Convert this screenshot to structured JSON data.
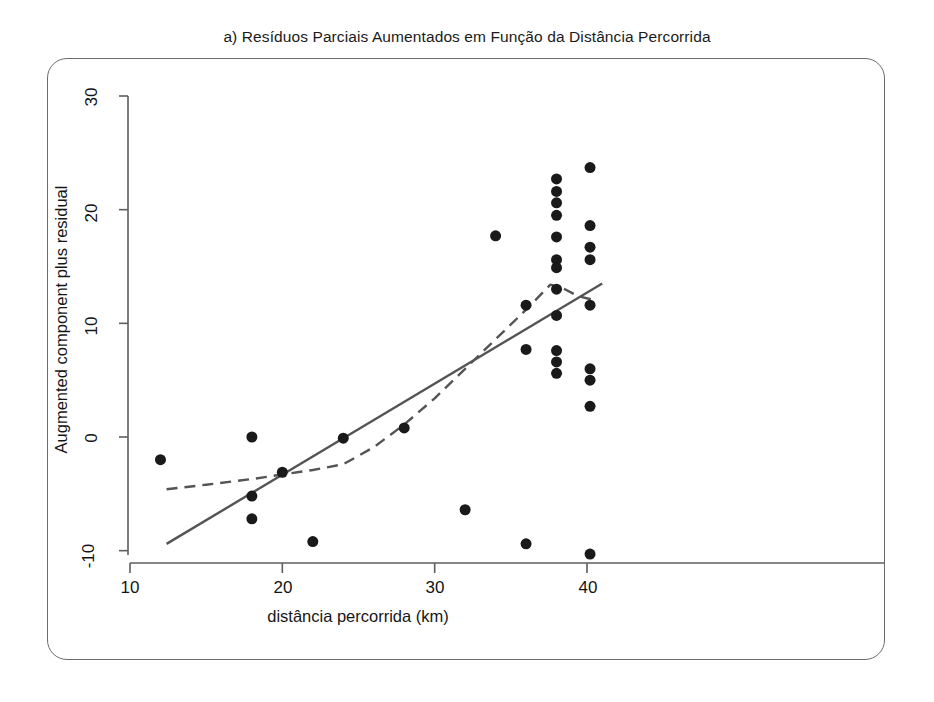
{
  "figure": {
    "title": "a) Resíduos Parciais Aumentados em Função da Distância Percorrida",
    "background_color": "#ffffff",
    "frame_color": "#6d6d6d"
  },
  "chart_data": {
    "type": "scatter",
    "title": "a) Resíduos Parciais Aumentados em Função da Distância Percorrida",
    "xlabel": "distância percorrida (km)",
    "ylabel": "Augmented component plus residual",
    "xlim": [
      9.0,
      41.5
    ],
    "ylim": [
      -11.2,
      32.5
    ],
    "xticks": [
      10,
      20,
      30,
      40
    ],
    "xtick_labels": [
      "10",
      "20",
      "30",
      "40"
    ],
    "yticks": [
      -10,
      0,
      10,
      20,
      30
    ],
    "ytick_labels": [
      "-10",
      "0",
      "10",
      "20",
      "30"
    ],
    "grid": false,
    "legend": null,
    "marker": {
      "shape": "circle",
      "color": "#1a1a1a",
      "size_px": 11
    },
    "points": [
      {
        "x": 12.0,
        "y": -2.0
      },
      {
        "x": 18.0,
        "y": 0.0
      },
      {
        "x": 18.0,
        "y": -5.2
      },
      {
        "x": 18.0,
        "y": -7.2
      },
      {
        "x": 20.0,
        "y": -3.1
      },
      {
        "x": 22.0,
        "y": -9.2
      },
      {
        "x": 24.0,
        "y": -0.1
      },
      {
        "x": 28.0,
        "y": 0.8
      },
      {
        "x": 32.0,
        "y": -6.4
      },
      {
        "x": 34.0,
        "y": 17.7
      },
      {
        "x": 36.0,
        "y": 11.6
      },
      {
        "x": 36.0,
        "y": 7.7
      },
      {
        "x": 36.0,
        "y": -9.4
      },
      {
        "x": 38.0,
        "y": 22.7
      },
      {
        "x": 38.0,
        "y": 21.6
      },
      {
        "x": 38.0,
        "y": 20.6
      },
      {
        "x": 38.0,
        "y": 19.5
      },
      {
        "x": 38.0,
        "y": 17.6
      },
      {
        "x": 38.0,
        "y": 15.6
      },
      {
        "x": 38.0,
        "y": 14.9
      },
      {
        "x": 38.0,
        "y": 13.0
      },
      {
        "x": 38.0,
        "y": 10.7
      },
      {
        "x": 38.0,
        "y": 7.6
      },
      {
        "x": 38.0,
        "y": 6.6
      },
      {
        "x": 38.0,
        "y": 5.6
      },
      {
        "x": 40.2,
        "y": 23.7
      },
      {
        "x": 40.2,
        "y": 18.6
      },
      {
        "x": 40.2,
        "y": 16.7
      },
      {
        "x": 40.2,
        "y": 15.6
      },
      {
        "x": 40.2,
        "y": 11.6
      },
      {
        "x": 40.2,
        "y": 6.0
      },
      {
        "x": 40.2,
        "y": 5.0
      },
      {
        "x": 40.2,
        "y": 2.7
      },
      {
        "x": 40.2,
        "y": -10.3
      }
    ],
    "series": [
      {
        "name": "linear component line",
        "style": "solid",
        "color": "#545454",
        "width_px": 2.4,
        "points": [
          {
            "x": 12.4,
            "y": -9.4
          },
          {
            "x": 41.0,
            "y": 13.5
          }
        ]
      },
      {
        "name": "smoothed residual curve",
        "style": "dashed",
        "color": "#545454",
        "width_px": 2.4,
        "dash_pattern": "11 7",
        "points": [
          {
            "x": 12.4,
            "y": -4.6
          },
          {
            "x": 15.0,
            "y": -4.2
          },
          {
            "x": 18.0,
            "y": -3.7
          },
          {
            "x": 20.0,
            "y": -3.3
          },
          {
            "x": 22.0,
            "y": -2.9
          },
          {
            "x": 24.0,
            "y": -2.4
          },
          {
            "x": 26.0,
            "y": -0.9
          },
          {
            "x": 28.0,
            "y": 1.1
          },
          {
            "x": 30.0,
            "y": 3.4
          },
          {
            "x": 32.0,
            "y": 6.0
          },
          {
            "x": 34.0,
            "y": 8.6
          },
          {
            "x": 36.0,
            "y": 11.2
          },
          {
            "x": 37.6,
            "y": 13.4
          },
          {
            "x": 38.4,
            "y": 13.1
          },
          {
            "x": 39.4,
            "y": 12.4
          },
          {
            "x": 40.6,
            "y": 12.0
          }
        ]
      }
    ]
  }
}
